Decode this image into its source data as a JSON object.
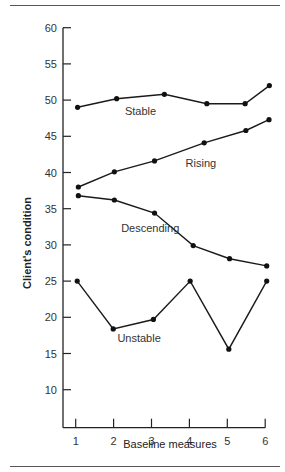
{
  "figure": {
    "title_fragment": "",
    "top_rule": true,
    "bottom_rule": true
  },
  "chart_data": {
    "type": "line",
    "title": "",
    "xlabel": "Baseline measures",
    "ylabel": "Client's condition",
    "xlim": [
      1,
      6
    ],
    "ylim": [
      5,
      60
    ],
    "x_ticks": [
      1,
      2,
      3,
      4,
      5,
      6
    ],
    "y_ticks": [
      10,
      15,
      20,
      25,
      30,
      35,
      40,
      45,
      50,
      55,
      60
    ],
    "grid": false,
    "legend": "inline labels",
    "series": [
      {
        "name": "Stable",
        "label_pos": [
          2.3,
          48.0
        ],
        "x": [
          1.05,
          2.08,
          3.34,
          4.46,
          5.47,
          6.11
        ],
        "values": [
          49.0,
          50.2,
          50.8,
          49.5,
          49.5,
          52.0
        ]
      },
      {
        "name": "Rising",
        "label_pos": [
          3.9,
          40.8
        ],
        "x": [
          1.07,
          2.02,
          3.08,
          4.39,
          5.49,
          6.1
        ],
        "values": [
          38.0,
          40.1,
          41.6,
          44.1,
          45.8,
          47.3
        ]
      },
      {
        "name": "Descending",
        "label_pos": [
          2.2,
          31.8
        ],
        "x": [
          1.07,
          2.02,
          3.08,
          4.1,
          5.06,
          6.04
        ],
        "values": [
          36.8,
          36.2,
          34.4,
          29.9,
          28.1,
          27.1
        ]
      },
      {
        "name": "Unstable",
        "label_pos": [
          2.1,
          16.6
        ],
        "x": [
          1.04,
          1.99,
          3.05,
          4.02,
          5.04,
          6.04
        ],
        "values": [
          25.0,
          18.4,
          19.7,
          25.0,
          15.6,
          25.0
        ]
      }
    ]
  }
}
